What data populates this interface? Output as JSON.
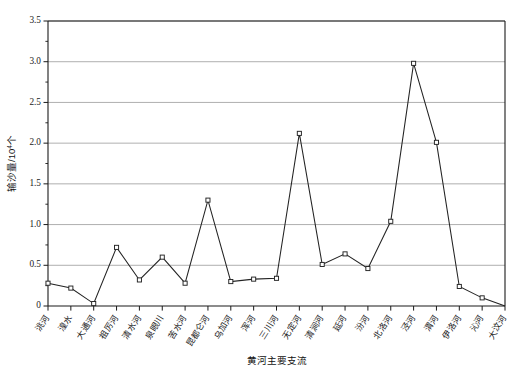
{
  "chart_data": {
    "type": "line",
    "title": "",
    "xlabel": "黄河主要支流",
    "ylabel": "输沙量/10",
    "ylabel_exponent": "4",
    "ylabel_unit": "个",
    "ylim": [
      0,
      3.5
    ],
    "xlim_categories_count": 21,
    "grid": "horizontal",
    "legend": "none",
    "marker": "open-square",
    "ytick_labels": [
      "0",
      "0.5",
      "1.0",
      "1.5",
      "2.0",
      "2.5",
      "3.0",
      "3.5"
    ],
    "ytick_values": [
      0,
      0.5,
      1.0,
      1.5,
      2.0,
      2.5,
      3.0,
      3.5
    ],
    "yminor_tick_values": [
      0.25,
      0.75,
      1.25,
      1.75,
      2.25,
      2.75,
      3.25
    ],
    "categories": [
      "洮河",
      "湟水",
      "大通河",
      "祖厉河",
      "清水河",
      "泉眼川",
      "苦水河",
      "昆都仑河",
      "乌加河",
      "浑河",
      "三川河",
      "无定河",
      "清涧河",
      "延河",
      "汾河",
      "北洛河",
      "泾河",
      "渭河",
      "伊洛河",
      "沁河",
      "大汶河"
    ],
    "values": [
      0.28,
      0.22,
      0.03,
      0.72,
      0.32,
      0.6,
      0.28,
      1.3,
      0.3,
      0.33,
      0.34,
      2.12,
      0.51,
      0.64,
      0.46,
      1.04,
      2.98,
      2.01,
      0.24,
      0.1,
      0.0
    ],
    "colors": {
      "line": "#232323",
      "marker_fill": "#ffffff",
      "marker_stroke": "#232323",
      "gridline": "#9a9a9a",
      "axis": "#1a1a1a"
    }
  }
}
